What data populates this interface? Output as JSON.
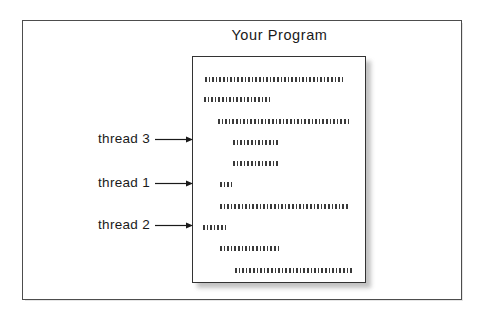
{
  "figure": {
    "title": "Your Program",
    "width": 482,
    "height": 318,
    "background_color": "#ffffff",
    "frame_color": "#4d4d4d",
    "ink_color": "#1a1a1a",
    "page_border_color": "#333333",
    "page_fill_color": "#ffffff",
    "page_shadow_color": "#b8b8b8",
    "code_dot_color": "#3a3a3a"
  },
  "program_page": {
    "name": "program-page",
    "x": 192,
    "y": 56,
    "width": 174,
    "height": 227,
    "code_lines": [
      {
        "id": "code-line-1",
        "indent": 12,
        "length": 139,
        "top": 20
      },
      {
        "id": "code-line-2",
        "indent": 11,
        "length": 68,
        "top": 40
      },
      {
        "id": "code-line-3",
        "indent": 25,
        "length": 131,
        "top": 62
      },
      {
        "id": "code-line-4",
        "indent": 40,
        "length": 47,
        "top": 83
      },
      {
        "id": "code-line-5",
        "indent": 40,
        "length": 47,
        "top": 104
      },
      {
        "id": "code-line-6",
        "indent": 27,
        "length": 12,
        "top": 125
      },
      {
        "id": "code-line-7",
        "indent": 27,
        "length": 128,
        "top": 147
      },
      {
        "id": "code-line-8",
        "indent": 10,
        "length": 25,
        "top": 168
      },
      {
        "id": "code-line-9",
        "indent": 27,
        "length": 60,
        "top": 189
      },
      {
        "id": "code-line-10",
        "indent": 42,
        "length": 118,
        "top": 211
      }
    ]
  },
  "annotations": [
    {
      "id": "thread-3",
      "label": "thread 3",
      "label_x": 88,
      "label_y": 131,
      "label_width": 62,
      "arrow_x": 155,
      "arrow_y": 135,
      "arrow_length": 38,
      "points_to_code_line": "code-line-4"
    },
    {
      "id": "thread-1",
      "label": "thread 1",
      "label_x": 88,
      "label_y": 175,
      "label_width": 62,
      "arrow_x": 155,
      "arrow_y": 179,
      "arrow_length": 38,
      "points_to_code_line": "code-line-6"
    },
    {
      "id": "thread-2",
      "label": "thread 2",
      "label_x": 88,
      "label_y": 217,
      "label_width": 62,
      "arrow_x": 155,
      "arrow_y": 221,
      "arrow_length": 38,
      "points_to_code_line": "code-line-8"
    }
  ]
}
